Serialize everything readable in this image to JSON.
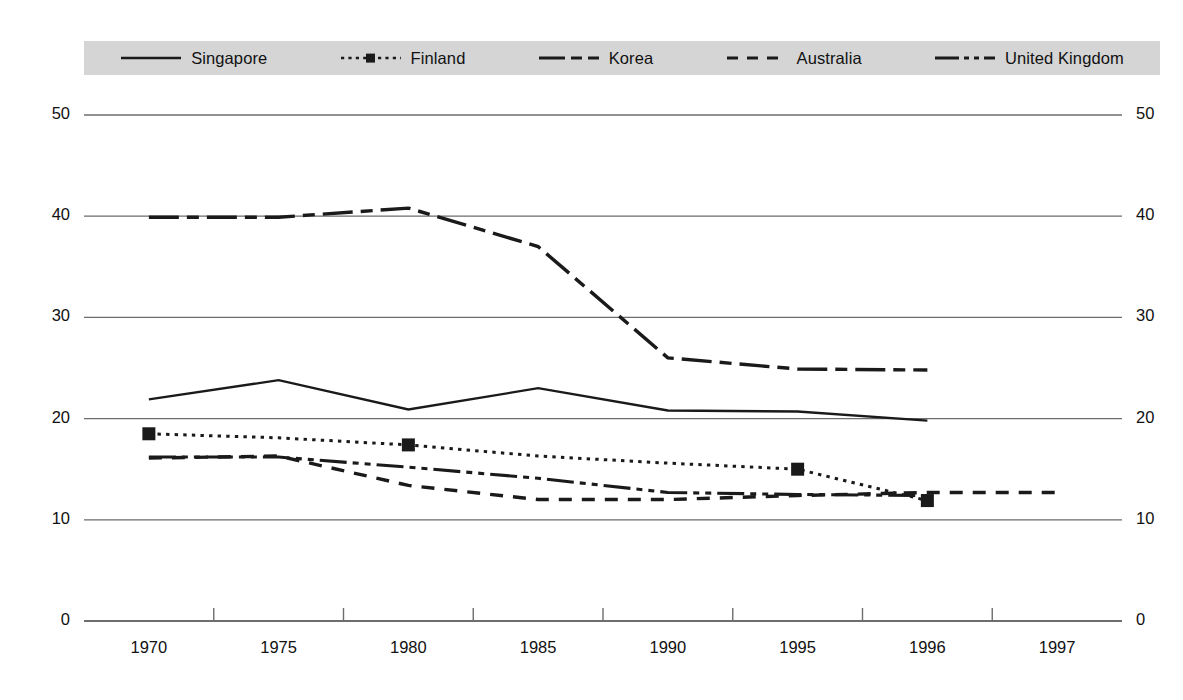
{
  "chart_data": {
    "type": "line",
    "title": "",
    "xlabel": "",
    "ylabel": "",
    "categories": [
      "1970",
      "1975",
      "1980",
      "1985",
      "1990",
      "1995",
      "1996",
      "1997"
    ],
    "ylim": [
      0,
      50
    ],
    "yticks": [
      0,
      10,
      20,
      30,
      40,
      50
    ],
    "ytick_labels_left": [
      "50",
      "40",
      "30",
      "20",
      "10",
      "0"
    ],
    "ytick_labels_right": [
      "50",
      "40",
      "30",
      "20",
      "10",
      "0"
    ],
    "grid": true,
    "legend_position": "top",
    "series": [
      {
        "name": "Singapore",
        "style": "solid",
        "marker": "none",
        "color": "#1a1a1a",
        "x": [
          "1970",
          "1975",
          "1980",
          "1985",
          "1990",
          "1995",
          "1996"
        ],
        "values": [
          21.9,
          23.8,
          20.9,
          23.0,
          20.8,
          20.7,
          19.8
        ]
      },
      {
        "name": "Finland",
        "style": "dotted",
        "marker": "square",
        "color": "#1a1a1a",
        "x": [
          "1970",
          "1975",
          "1980",
          "1985",
          "1990",
          "1995",
          "1996"
        ],
        "values": [
          18.5,
          18.1,
          17.4,
          16.3,
          15.6,
          15.0,
          11.9
        ],
        "marker_points": [
          {
            "x": "1970",
            "y": 18.5
          },
          {
            "x": "1980",
            "y": 17.4
          },
          {
            "x": "1995",
            "y": 15.0
          },
          {
            "x": "1996",
            "y": 11.9
          }
        ]
      },
      {
        "name": "Korea",
        "style": "dash-dot",
        "marker": "none",
        "color": "#1a1a1a",
        "x": [
          "1970",
          "1975",
          "1980",
          "1985",
          "1990",
          "1995",
          "1996"
        ],
        "values": [
          39.9,
          39.9,
          40.8,
          37.0,
          26.0,
          24.9,
          24.8
        ]
      },
      {
        "name": "Australia",
        "style": "dashed",
        "marker": "none",
        "color": "#1a1a1a",
        "x": [
          "1970",
          "1975",
          "1980",
          "1985",
          "1990",
          "1995",
          "1996",
          "1997"
        ],
        "values": [
          16.1,
          16.3,
          13.4,
          12.0,
          12.0,
          12.4,
          12.7,
          12.7
        ]
      },
      {
        "name": "United Kingdom",
        "style": "dash-dot-dot",
        "marker": "none",
        "color": "#1a1a1a",
        "x": [
          "1970",
          "1975",
          "1980",
          "1985",
          "1990",
          "1995",
          "1996"
        ],
        "values": [
          16.2,
          16.2,
          15.2,
          14.1,
          12.7,
          12.5,
          12.4
        ]
      }
    ]
  },
  "legend": {
    "items": [
      {
        "label": "Singapore",
        "swatch": "line-solid-swatch"
      },
      {
        "label": "Finland",
        "swatch": "line-dotted-square-swatch"
      },
      {
        "label": "Korea",
        "swatch": "line-dash-dot-swatch"
      },
      {
        "label": "Australia",
        "swatch": "line-dashed-swatch"
      },
      {
        "label": "United Kingdom",
        "swatch": "line-dash-dot-dot-swatch"
      }
    ]
  },
  "axes": {
    "y_left": [
      "50",
      "40",
      "30",
      "20",
      "10",
      "0"
    ],
    "y_right": [
      "50",
      "40",
      "30",
      "20",
      "10",
      "0"
    ],
    "x": [
      "1970",
      "1975",
      "1980",
      "1985",
      "1990",
      "1995",
      "1996",
      "1997"
    ]
  },
  "colors": {
    "ink": "#1a1a1a",
    "grid": "#6d6d6d",
    "legend_band": "#d5d5d5",
    "background": "#ffffff"
  }
}
